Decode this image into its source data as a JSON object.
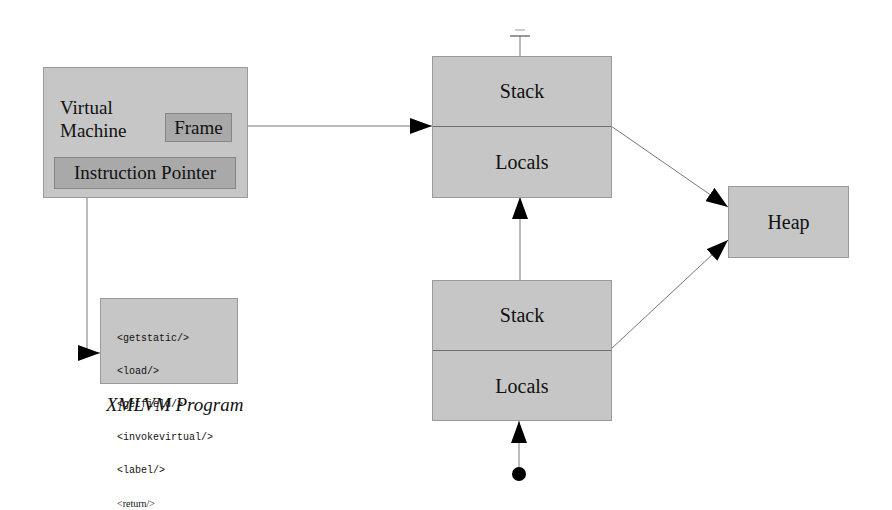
{
  "vm": {
    "title_line1": "Virtual",
    "title_line2": "Machine",
    "frame_label": "Frame",
    "ip_label": "Instruction Pointer"
  },
  "program": {
    "lines": [
      "<getstatic/>",
      "<load/>",
      "<getfield/>",
      "<invokevirtual/>",
      "<label/>",
      "<return/>"
    ],
    "caption": "XMLVM Program"
  },
  "frame_top": {
    "stack_label": "Stack",
    "locals_label": "Locals"
  },
  "frame_bottom": {
    "stack_label": "Stack",
    "locals_label": "Locals"
  },
  "heap": {
    "label": "Heap"
  },
  "colors": {
    "box_fill": "#c6c6c6",
    "inner_fill": "#a9a9a9",
    "line": "#777777",
    "arrowhead": "#000000"
  }
}
